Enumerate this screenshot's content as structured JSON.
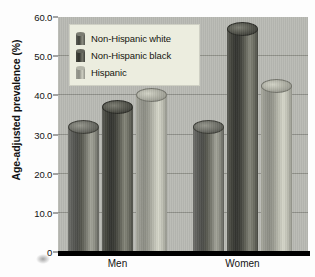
{
  "chart_data": {
    "type": "bar",
    "title": "",
    "subtitle": "",
    "xlabel": "",
    "ylabel": "Age-adjusted prevalence (%)",
    "categories": [
      "Men",
      "Women"
    ],
    "series": [
      {
        "name": "Non-Hispanic white",
        "values": [
          32.0,
          32.0
        ],
        "color": "#55564f"
      },
      {
        "name": "Non-Hispanic black",
        "values": [
          37.0,
          57.0
        ],
        "color": "#3a3b34"
      },
      {
        "name": "Hispanic",
        "values": [
          40.0,
          42.5
        ],
        "color": "#b0b1a5"
      }
    ],
    "ylim": [
      0,
      60
    ],
    "yticks": [
      0,
      10.0,
      20.0,
      30.0,
      40.0,
      50.0,
      60.0
    ],
    "ytick_labels": [
      "0",
      "10.0",
      "20.0",
      "30.0",
      "40.0",
      "50.0",
      "60.0"
    ],
    "grid": true,
    "grid_axis": "y",
    "legend_position": "upper left",
    "bar_style": "3d-cylinder",
    "plot_background": "#b9bab4",
    "legend_background": "#eceddf",
    "axis_color": "#000000"
  }
}
